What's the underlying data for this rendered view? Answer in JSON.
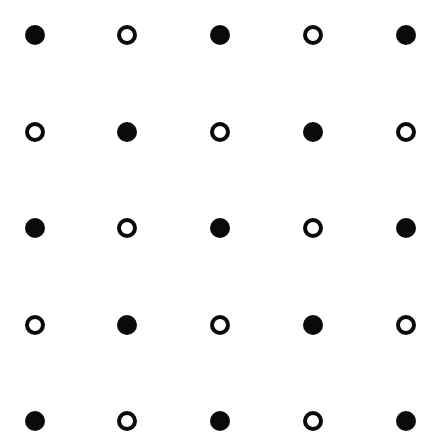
{
  "diagram": {
    "type": "dot-grid",
    "rows": 5,
    "cols": 5,
    "dot_diameter": 20,
    "color": "#0a0a0a",
    "background": "#ffffff",
    "col_x": [
      35,
      127,
      220,
      313,
      406
    ],
    "row_y": [
      35,
      132,
      228,
      325,
      421
    ],
    "pattern": [
      [
        "filled",
        "hollow",
        "filled",
        "hollow",
        "filled"
      ],
      [
        "hollow",
        "filled",
        "hollow",
        "filled",
        "hollow"
      ],
      [
        "filled",
        "hollow",
        "filled",
        "hollow",
        "filled"
      ],
      [
        "hollow",
        "filled",
        "hollow",
        "filled",
        "hollow"
      ],
      [
        "filled",
        "hollow",
        "filled",
        "hollow",
        "filled"
      ]
    ]
  }
}
